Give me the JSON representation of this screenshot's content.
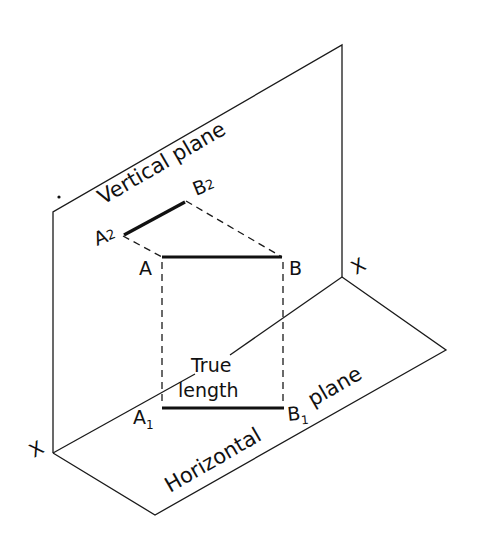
{
  "diagram": {
    "colors": {
      "ink": "#111111",
      "background": "#ffffff"
    },
    "planes": {
      "vertical": {
        "label": "Vertical plane"
      },
      "horizontal": {
        "label_left": "Horizontal",
        "label_right": "plane"
      }
    },
    "axis": {
      "left_label": "X",
      "right_label": "X"
    },
    "points": {
      "A": "A",
      "B": "B",
      "A2": {
        "base": "A",
        "sub": "2"
      },
      "B2": {
        "base": "B",
        "sub": "2"
      },
      "A1": {
        "base": "A",
        "sub": "1"
      },
      "B1": {
        "base": "B",
        "sub": "1"
      }
    },
    "annotation": {
      "line1": "True",
      "line2": "length"
    }
  }
}
